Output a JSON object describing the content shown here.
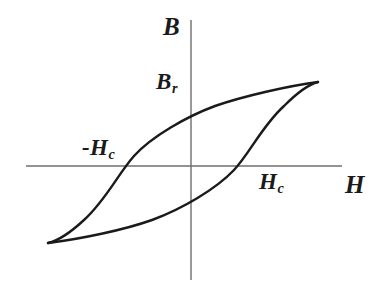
{
  "figure": {
    "background_color": "#ffffff",
    "curve_color": "#1a1a1a",
    "axis_color": "#6e6e6e",
    "label_color": "#1a1a1a"
  },
  "axes": {
    "vertical": {
      "name": "B",
      "label": "B",
      "x": 191,
      "y_top": 20,
      "y_bottom": 280
    },
    "horizontal": {
      "name": "H",
      "label": "H",
      "y": 166,
      "x_left": 26,
      "x_right": 342
    }
  },
  "labels": {
    "b_axis": "B",
    "h_axis": "H",
    "remanence_symbol": "B",
    "remanence_subscript": "r",
    "coercivity_negative_prefix": "-",
    "coercivity_symbol": "H",
    "coercivity_subscript": "c",
    "coercivity_positive_symbol": "H"
  },
  "chart_data": {
    "type": "line",
    "xlabel": "H",
    "ylabel": "B",
    "grid": false,
    "legend": null,
    "origin_px": {
      "x": 191,
      "y": 166
    },
    "annotations": [
      {
        "text": "B",
        "role": "y-axis-label",
        "x_px": 172,
        "y_px": 28
      },
      {
        "text": "Br",
        "role": "remanence",
        "x_px": 168,
        "y_px": 84
      },
      {
        "text": "-Hc",
        "role": "negative-coercivity",
        "x_px": 103,
        "y_px": 150
      },
      {
        "text": "Hc",
        "role": "positive-coercivity",
        "x_px": 272,
        "y_px": 185
      },
      {
        "text": "H",
        "role": "x-axis-label",
        "x_px": 353,
        "y_px": 187
      }
    ],
    "key_points_px": {
      "saturation_positive": {
        "x": 318,
        "y": 82
      },
      "saturation_negative": {
        "x": 48,
        "y": 243
      },
      "remanence_positive": {
        "x": 191,
        "y": 97
      },
      "remanence_negative": {
        "x": 191,
        "y": 227
      },
      "coercivity_negative": {
        "x": 124,
        "y": 166
      },
      "coercivity_positive": {
        "x": 256,
        "y": 166
      }
    },
    "series": [
      {
        "name": "upper-branch (decreasing H)",
        "path": "M 318 82 C 288 86 244 96 215 106 C 188 116 152 136 134 156 C 118 174 106 200 84 220 C 70 233 57 241 48 243"
      },
      {
        "name": "lower-branch (increasing H)",
        "path": "M 48 243 C 80 239 124 230 152 220 C 182 209 216 189 234 170 C 250 153 262 126 284 106 C 298 92 310 84 318 82"
      }
    ]
  }
}
